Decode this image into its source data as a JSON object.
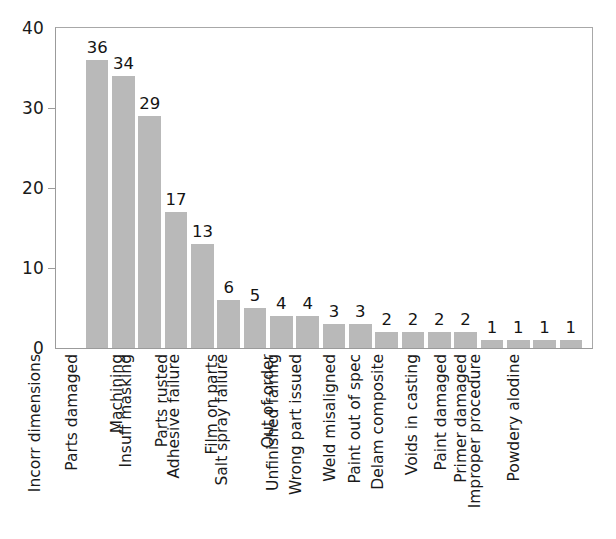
{
  "chart_data": {
    "type": "bar",
    "title": "",
    "subtitle": "",
    "xlabel": "",
    "ylabel": "",
    "ylim": [
      0,
      40
    ],
    "yticks": [
      0,
      10,
      20,
      30,
      40
    ],
    "ytick_labels": [
      "0",
      "10",
      "20",
      "30",
      "40"
    ],
    "grid": false,
    "legend": "none",
    "orientation": "vertical",
    "bar_color": "#b9b9b9",
    "value_labels_shown": true,
    "xtick_label_rotation": 90,
    "categories": [
      "Incorr dimensions",
      "Parts damaged",
      "Machining",
      "Insuff masking",
      "Parts rusted",
      "Adhesive failure",
      "Film on parts",
      "Salt spray failure",
      "Out of order",
      "Unfinished fairing",
      "Wrong part issued",
      "Weld misaligned",
      "Paint out of spec",
      "Delam composite",
      "Voids in casting",
      "Paint damaged",
      "Primer damaged",
      "Improper procedure",
      "Powdery alodine"
    ],
    "values": [
      36,
      34,
      29,
      17,
      13,
      6,
      5,
      4,
      4,
      3,
      3,
      2,
      2,
      2,
      2,
      1,
      1,
      1,
      1
    ]
  },
  "axis": {
    "frame_color": "#9b9b9b"
  }
}
